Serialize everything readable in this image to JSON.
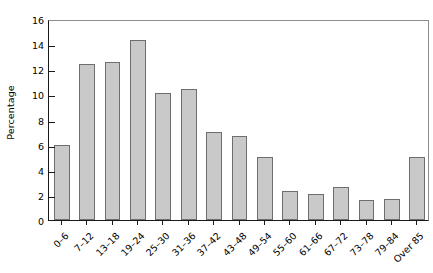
{
  "chart_data": {
    "type": "bar",
    "title": "",
    "subtitle": "",
    "xlabel": "",
    "ylabel": "Percentage",
    "ylim": [
      0,
      16
    ],
    "y_ticks": [
      0,
      2,
      4,
      6,
      8,
      10,
      12,
      14,
      16
    ],
    "grid": false,
    "legend": null,
    "legend_position": "none",
    "bar_color": "#c9c9c9",
    "bar_edge_color": "#6e6e6e",
    "axis_color": "#1a1a1a",
    "frame_color": "#8c8c8c",
    "categories": [
      "0–6",
      "7–12",
      "13–18",
      "19–24",
      "25–30",
      "31–36",
      "37–42",
      "43–48",
      "49–54",
      "55–60",
      "61–66",
      "67–72",
      "73–78",
      "79–84",
      "Over 85"
    ],
    "values": [
      6.0,
      12.4,
      12.6,
      14.3,
      10.1,
      10.4,
      7.0,
      6.7,
      5.0,
      2.3,
      2.1,
      2.6,
      1.6,
      1.7,
      5.0
    ]
  }
}
